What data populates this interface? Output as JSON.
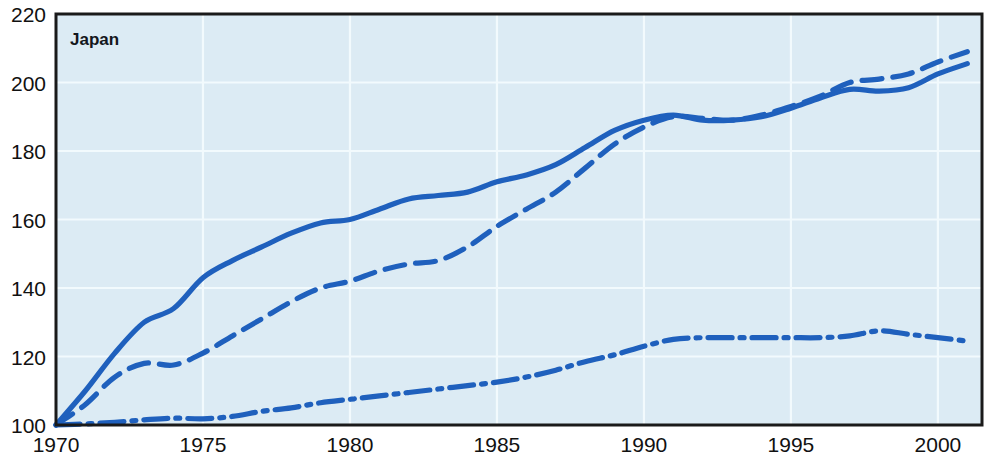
{
  "chart_data": {
    "type": "line",
    "title": "Japan",
    "xlabel": "",
    "ylabel": "",
    "xlim": [
      1970,
      2001.5
    ],
    "ylim": [
      100,
      220
    ],
    "grid": true,
    "legend": "none",
    "background_color": "#dcebf4",
    "line_color": "#1f60bd",
    "axis_color": "#1a1a1a",
    "gridline_color": "#f2fafd",
    "xticks": [
      1970,
      1975,
      1980,
      1985,
      1990,
      1995,
      2000
    ],
    "xtick_labels": [
      "1970",
      "1975",
      "1980",
      "1985",
      "1990",
      "1995",
      "2000"
    ],
    "yticks": [
      100,
      120,
      140,
      160,
      180,
      200,
      220
    ],
    "ytick_labels": [
      "100",
      "120",
      "140",
      "160",
      "180",
      "200",
      "220"
    ],
    "x": [
      1970,
      1971,
      1972,
      1973,
      1974,
      1975,
      1976,
      1977,
      1978,
      1979,
      1980,
      1981,
      1982,
      1983,
      1984,
      1985,
      1986,
      1987,
      1988,
      1989,
      1990,
      1991,
      1992,
      1993,
      1994,
      1995,
      1996,
      1997,
      1998,
      1999,
      2000,
      2001
    ],
    "series": [
      {
        "name": "series-solid",
        "style": "solid",
        "color": "#1f60bd",
        "values": [
          100,
          110,
          121,
          130,
          134,
          143,
          148,
          152,
          156,
          159,
          160,
          163,
          166,
          167,
          168,
          171,
          173,
          176,
          181,
          186,
          189,
          190.5,
          189,
          189,
          190,
          192.5,
          195.5,
          198,
          197.5,
          198.5,
          202.5,
          205.5
        ]
      },
      {
        "name": "series-dashed",
        "style": "dashed",
        "color": "#1f60bd",
        "values": [
          100,
          106,
          114,
          118,
          117.5,
          121,
          126,
          131,
          136,
          140,
          142,
          145,
          147,
          148,
          152,
          158,
          163,
          168,
          175,
          182,
          187,
          190,
          189.5,
          189,
          190.5,
          193,
          196,
          200,
          201,
          202.5,
          206,
          209
        ]
      },
      {
        "name": "series-dash-dot",
        "style": "dash-dot",
        "color": "#1f60bd",
        "values": [
          100,
          100.3,
          100.8,
          101.5,
          102,
          101.8,
          102.5,
          104,
          105,
          106.5,
          107.5,
          108.5,
          109.5,
          110.5,
          111.5,
          112.5,
          114,
          116,
          118.5,
          120.5,
          123,
          125,
          125.5,
          125.5,
          125.5,
          125.5,
          125.5,
          126,
          127.5,
          126.5,
          125.5,
          124.5
        ]
      }
    ]
  }
}
